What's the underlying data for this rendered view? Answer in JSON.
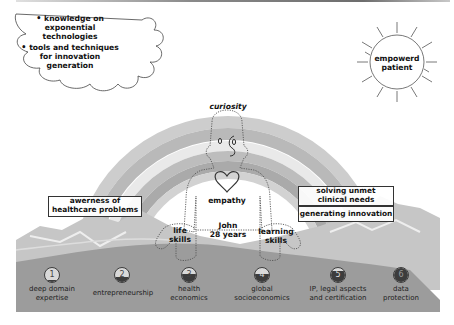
{
  "cloud": {
    "bullets": [
      {
        "lines": [
          "knowledge on",
          "exponential",
          "technologies"
        ]
      },
      {
        "lines": [
          "tools and techniques",
          "for innovation",
          "generation"
        ]
      }
    ]
  },
  "sun": {
    "label_line1": "empowerd",
    "label_line2": "patient"
  },
  "figure": {
    "head_label": "curiosity",
    "heart_label": "empathy",
    "name_line1": "John",
    "name_line2": "28 years",
    "left_hand_line1": "life",
    "left_hand_line2": "skills",
    "right_hand_line1": "learning",
    "right_hand_line2": "skills"
  },
  "boxes": {
    "left_line1": "awerness of",
    "left_line2": "healthcare problems",
    "right_top_line1": "solving unmet",
    "right_top_line2": "clinical needs",
    "right_bottom": "generating innovation"
  },
  "steps": [
    {
      "num": "1",
      "line1": "deep domain",
      "line2": "expertise",
      "fill_pct": 12
    },
    {
      "num": "2",
      "line1": "entrepreneurship",
      "line2": "",
      "fill_pct": 38
    },
    {
      "num": "3",
      "line1": "health",
      "line2": "economics",
      "fill_pct": 55
    },
    {
      "num": "4",
      "line1": "global",
      "line2": "socioeconomics",
      "fill_pct": 55
    },
    {
      "num": "5",
      "line1": "IP, legal aspects",
      "line2": "and certification",
      "fill_pct": 80
    },
    {
      "num": "6",
      "line1": "data",
      "line2": "protection",
      "fill_pct": 100
    }
  ],
  "colors": {
    "ground": "#9b9b9b",
    "mountain": "#c4c4c4",
    "rainbow_outer": "#c9c9c9",
    "rainbow_light": "#e6e6e6",
    "rainbow_dark": "#b4b4b4",
    "badge_fill": "#3c3c3c"
  }
}
